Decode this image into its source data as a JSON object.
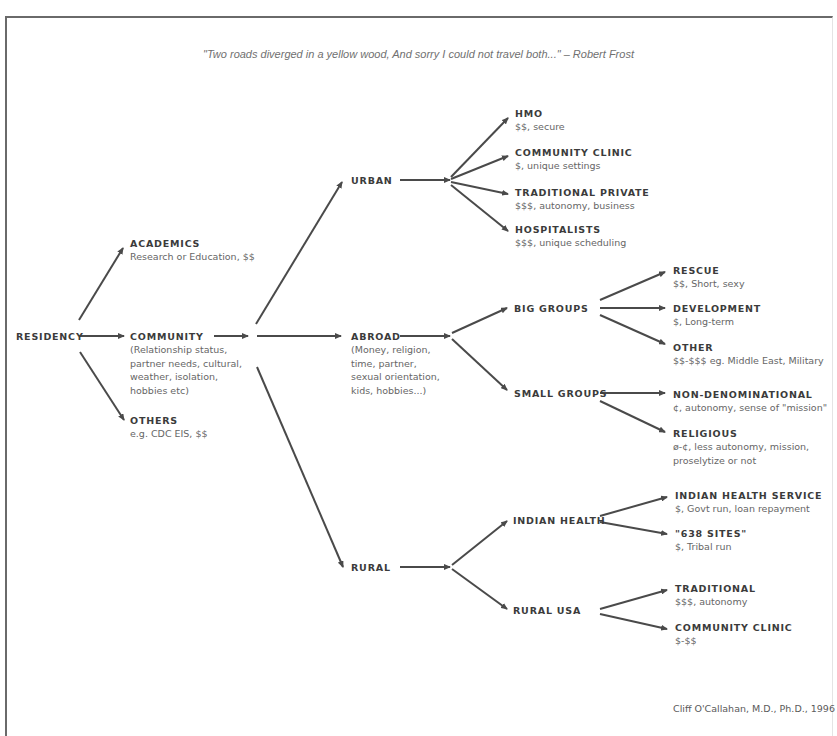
{
  "quote": {
    "text": "\"Two roads diverged in a yellow wood, And sorry I could not travel both...\"  – Robert Frost"
  },
  "credit": "Cliff O'Callahan, M.D., Ph.D., 1996",
  "colors": {
    "frame": "#6a6a6a",
    "arrow": "#4a4a4a",
    "title_text": "#3b3b3b",
    "desc_text": "#666666",
    "quote_text": "#707070"
  },
  "nodes": {
    "residency": {
      "title": "RESIDENCY"
    },
    "academics": {
      "title": "ACADEMICS",
      "desc": "Research or Education, $$"
    },
    "community": {
      "title": "COMMUNITY",
      "desc": "(Relationship status,\npartner needs, cultural,\nweather, isolation,\nhobbies etc)"
    },
    "others": {
      "title": "OTHERS",
      "desc": "e.g. CDC EIS, $$"
    },
    "urban": {
      "title": "URBAN"
    },
    "abroad": {
      "title": "ABROAD",
      "desc": "(Money, religion,\ntime, partner,\nsexual orientation,\nkids, hobbies...)"
    },
    "rural": {
      "title": "RURAL"
    },
    "hmo": {
      "title": "HMO",
      "desc": "$$, secure"
    },
    "urban_community_clinic": {
      "title": "COMMUNITY CLINIC",
      "desc": "$, unique settings"
    },
    "traditional_private": {
      "title": "TRADITIONAL PRIVATE",
      "desc": "$$$, autonomy, business"
    },
    "hospitalists": {
      "title": "HOSPITALISTS",
      "desc": "$$$, unique scheduling"
    },
    "big_groups": {
      "title": "BIG GROUPS"
    },
    "small_groups": {
      "title": "SMALL GROUPS"
    },
    "rescue": {
      "title": "RESCUE",
      "desc": "$$, Short, sexy"
    },
    "development": {
      "title": "DEVELOPMENT",
      "desc": "$, Long-term"
    },
    "other": {
      "title": "OTHER",
      "desc": "$$-$$$ eg. Middle East, Military"
    },
    "non_denominational": {
      "title": "NON-DENOMINATIONAL",
      "desc": "¢, autonomy, sense of \"mission\""
    },
    "religious": {
      "title": "RELIGIOUS",
      "desc": "ø-¢, less autonomy, mission,\nproselytize or not"
    },
    "indian_health": {
      "title": "INDIAN HEALTH"
    },
    "rural_usa": {
      "title": "RURAL USA"
    },
    "indian_health_service": {
      "title": "INDIAN HEALTH SERVICE",
      "desc": "$, Govt run, loan repayment"
    },
    "sites_638": {
      "title": "\"638 SITES\"",
      "desc": "$, Tribal run"
    },
    "traditional": {
      "title": "TRADITIONAL",
      "desc": "$$$, autonomy"
    },
    "rural_community_clinic": {
      "title": "COMMUNITY CLINIC",
      "desc": "$-$$"
    }
  },
  "edges": [
    [
      "residency",
      "academics"
    ],
    [
      "residency",
      "community"
    ],
    [
      "residency",
      "others"
    ],
    [
      "community",
      "urban"
    ],
    [
      "community",
      "abroad"
    ],
    [
      "community",
      "rural"
    ],
    [
      "urban",
      "hmo"
    ],
    [
      "urban",
      "urban_community_clinic"
    ],
    [
      "urban",
      "traditional_private"
    ],
    [
      "urban",
      "hospitalists"
    ],
    [
      "abroad",
      "big_groups"
    ],
    [
      "abroad",
      "small_groups"
    ],
    [
      "big_groups",
      "rescue"
    ],
    [
      "big_groups",
      "development"
    ],
    [
      "big_groups",
      "other"
    ],
    [
      "small_groups",
      "non_denominational"
    ],
    [
      "small_groups",
      "religious"
    ],
    [
      "rural",
      "indian_health"
    ],
    [
      "rural",
      "rural_usa"
    ],
    [
      "indian_health",
      "indian_health_service"
    ],
    [
      "indian_health",
      "sites_638"
    ],
    [
      "rural_usa",
      "traditional"
    ],
    [
      "rural_usa",
      "rural_community_clinic"
    ]
  ]
}
